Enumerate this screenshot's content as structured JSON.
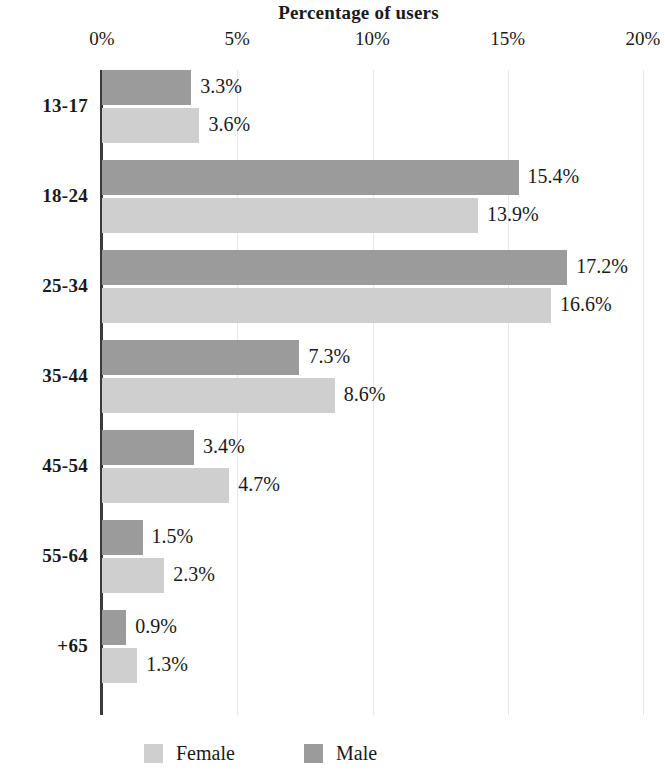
{
  "chart_data": {
    "type": "bar",
    "orientation": "horizontal",
    "title": "Percentage of users",
    "xlabel": "",
    "ylabel": "",
    "xlim": [
      0,
      20
    ],
    "xticks": [
      "0%",
      "5%",
      "10%",
      "15%",
      "20%"
    ],
    "xtick_values": [
      0,
      5,
      10,
      15,
      20
    ],
    "grid": true,
    "grid_axis": "x",
    "legend_position": "bottom",
    "categories": [
      "13-17",
      "18-24",
      "25-34",
      "35-44",
      "45-54",
      "55-64",
      "+65"
    ],
    "series": [
      {
        "name": "Male",
        "color": "#9b9b9b",
        "values": [
          3.3,
          15.4,
          17.2,
          7.3,
          3.4,
          1.5,
          0.9
        ],
        "labels": [
          "3.3%",
          "15.4%",
          "17.2%",
          "7.3%",
          "3.4%",
          "1.5%",
          "0.9%"
        ]
      },
      {
        "name": "Female",
        "color": "#cfcfcf",
        "values": [
          3.6,
          13.9,
          16.6,
          8.6,
          4.7,
          2.3,
          1.3
        ],
        "labels": [
          "3.6%",
          "13.9%",
          "16.6%",
          "8.6%",
          "4.7%",
          "2.3%",
          "1.3%"
        ]
      }
    ]
  },
  "legend": {
    "entries": [
      {
        "label": "Female",
        "swatch": "female"
      },
      {
        "label": "Male",
        "swatch": "male"
      }
    ]
  }
}
